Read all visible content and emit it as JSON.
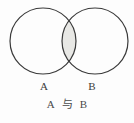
{
  "figure": {
    "type": "venn-diagram",
    "background_color": "#fdfdfd",
    "stroke_color": "#3a3a3a",
    "intersection_fill": "#e8e8e5",
    "left_set": {
      "label": "A",
      "center_x": 43,
      "center_y": 41,
      "radius": 33
    },
    "right_set": {
      "label": "B",
      "center_x": 95,
      "center_y": 41,
      "radius": 33
    },
    "highlighted_region": "intersection"
  },
  "caption": {
    "left_term": "A",
    "conjunction": "与",
    "right_term": "B",
    "full_text": "A 与 B"
  }
}
